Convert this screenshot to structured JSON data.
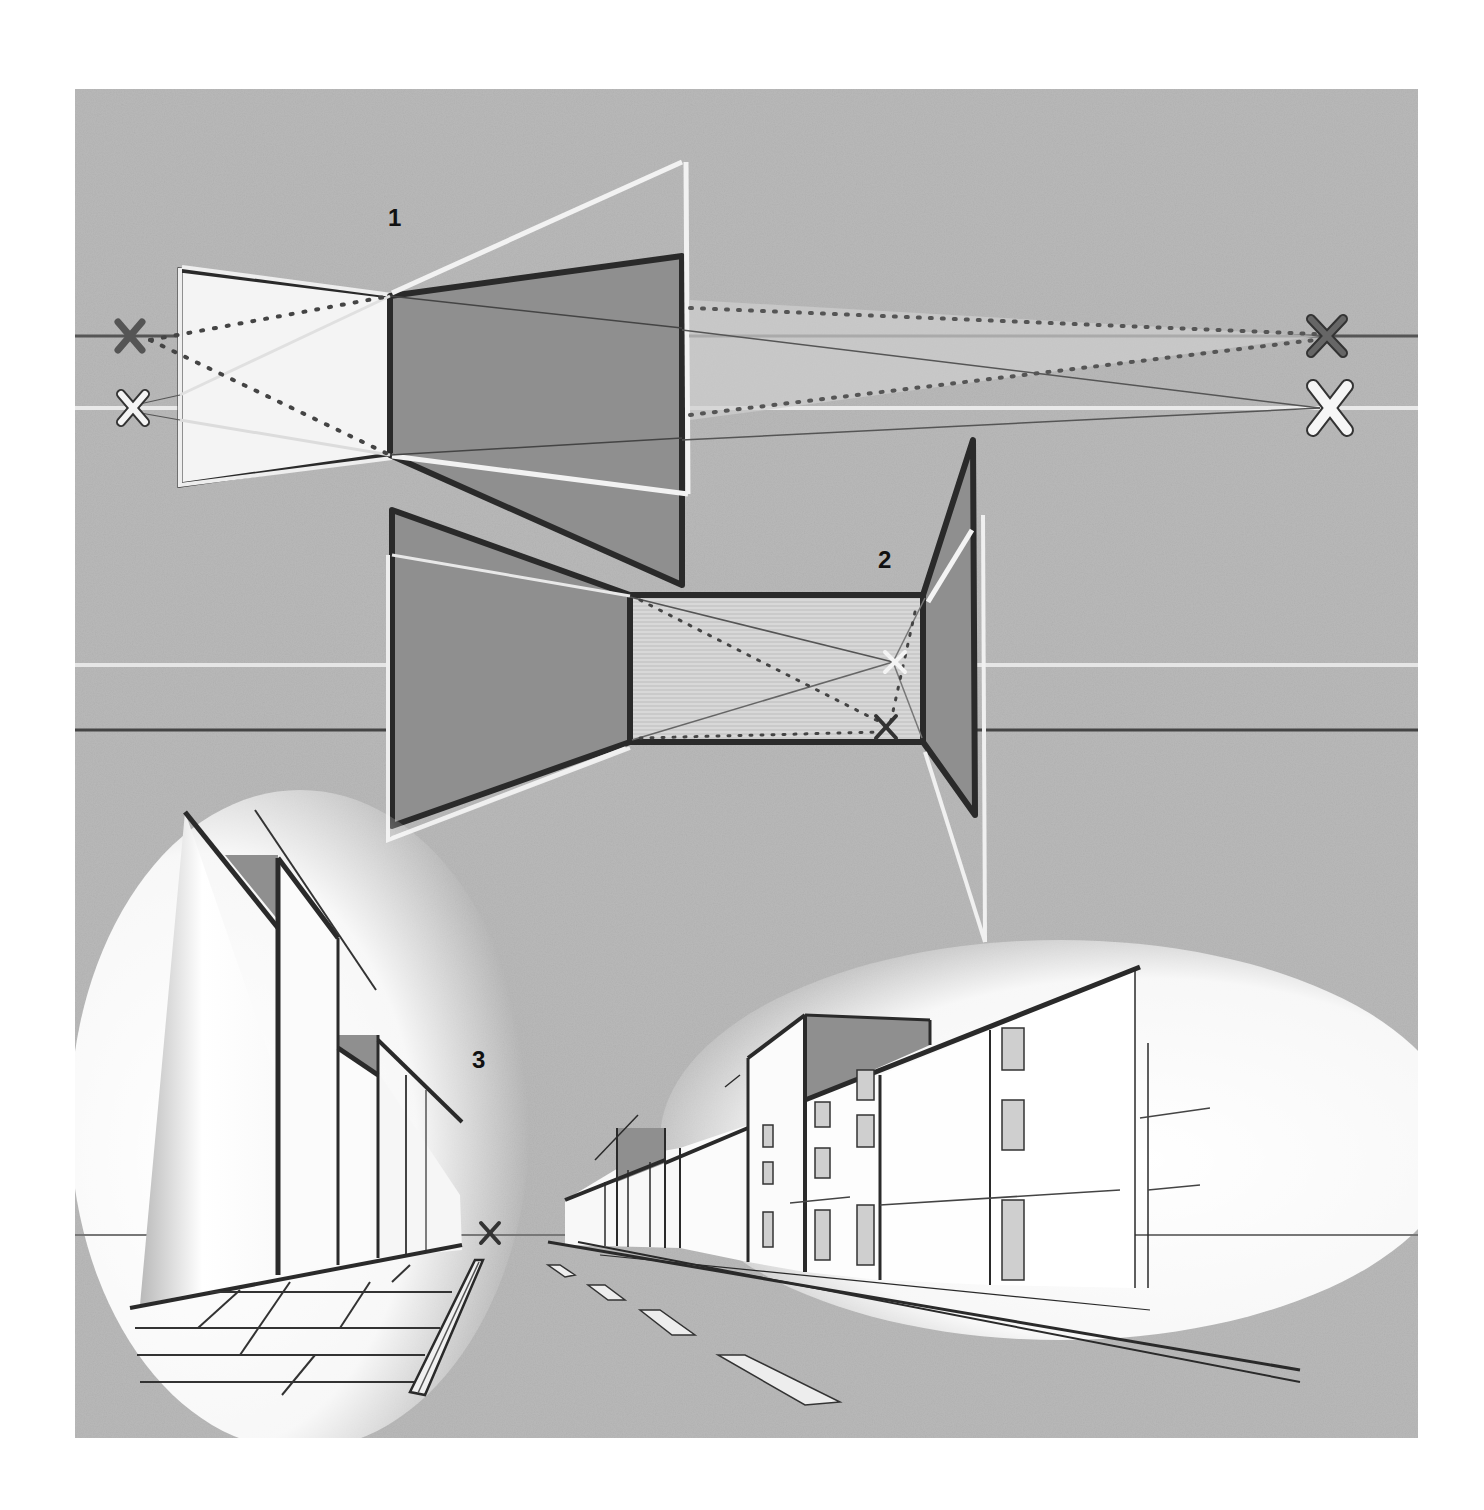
{
  "colors": {
    "page_bg": "#ffffff",
    "paper": "#b9b9b9",
    "paper_dark": "#a9a9a9",
    "panel_fill": "#8f8f8f",
    "ink": "#2a2a2a",
    "chalk": "#f2f2f2",
    "building_white": "#fbfbfb",
    "window_fill": "#cfcfcf"
  },
  "figures": [
    {
      "id": "1",
      "label": "1",
      "title": "Two-point perspective — walls seen from outside"
    },
    {
      "id": "2",
      "label": "2",
      "title": "One-point perspective — interior room"
    },
    {
      "id": "3",
      "label": "3",
      "title": "One-point perspective — street scene"
    }
  ],
  "horizon_lines": [
    {
      "figure": "1",
      "kind": "dark",
      "y": 336
    },
    {
      "figure": "1",
      "kind": "light",
      "y": 408
    },
    {
      "figure": "2",
      "kind": "light",
      "y": 665
    },
    {
      "figure": "2",
      "kind": "dark",
      "y": 727
    },
    {
      "figure": "3",
      "kind": "dark",
      "y": 1235
    }
  ],
  "vanishing_points": [
    {
      "figure": "1",
      "kind": "dark",
      "x": 130,
      "y": 336
    },
    {
      "figure": "1",
      "kind": "light",
      "x": 133,
      "y": 408
    },
    {
      "figure": "1",
      "kind": "dark",
      "x": 1327,
      "y": 336
    },
    {
      "figure": "1",
      "kind": "light",
      "x": 1330,
      "y": 408
    },
    {
      "figure": "2",
      "kind": "light",
      "x": 895,
      "y": 662
    },
    {
      "figure": "2",
      "kind": "dark",
      "x": 886,
      "y": 727
    },
    {
      "figure": "3",
      "kind": "dark",
      "x": 490,
      "y": 1233
    }
  ],
  "marker_glyph": "✕"
}
